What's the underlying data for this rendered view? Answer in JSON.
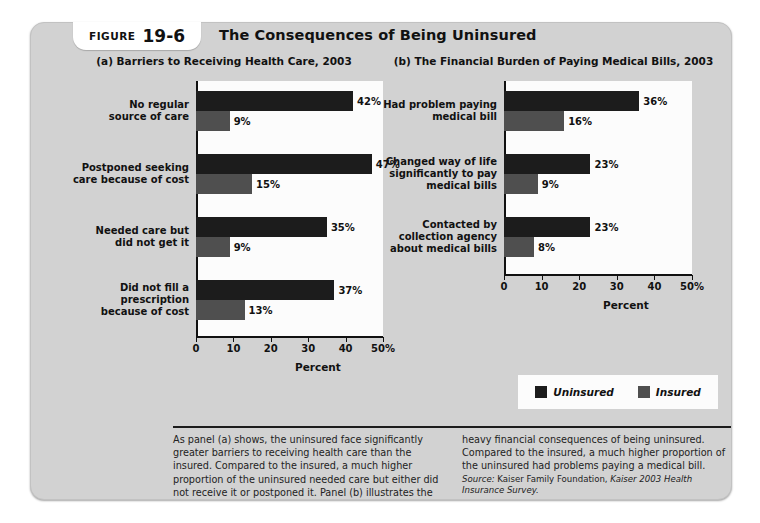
{
  "figure": {
    "label_word": "Figure",
    "number": "19-6",
    "title": "The Consequences of Being Uninsured"
  },
  "legend": {
    "items": [
      {
        "name": "Uninsured",
        "color": "#1c1c1c"
      },
      {
        "name": "Insured",
        "color": "#4f4f4f"
      }
    ]
  },
  "caption": {
    "left_text": "As panel (a) shows, the uninsured face significantly greater barriers to receiving health care than the insured. Compared to the insured, a much higher proportion of the uninsured needed care but either did not receive it or postponed it. Panel (b) illustrates the",
    "right_text": "heavy financial consequences of being uninsured. Compared to the insured, a much higher proportion of the uninsured had problems paying a medical bill.",
    "source_label": "Source:",
    "source_text": " Kaiser Family Foundation, ",
    "source_italic": "Kaiser 2003 Health Insurance Survey."
  },
  "chart_data": [
    {
      "type": "bar",
      "orientation": "horizontal",
      "panel": "(a)",
      "title": "(a) Barriers to Receiving Health Care, 2003",
      "xlabel": "Percent",
      "ylabel": "",
      "xlim": [
        0,
        50
      ],
      "ticks": [
        0,
        10,
        20,
        30,
        40,
        50
      ],
      "tick_labels": [
        "0",
        "10",
        "20",
        "30",
        "40",
        "50%"
      ],
      "grid": false,
      "legend_position": "below-right",
      "categories": [
        "No regular source of care",
        "Postponed seeking care because of cost",
        "Needed care but did not get it",
        "Did not fill a prescription because of cost"
      ],
      "category_lines": [
        [
          "No regular",
          "source of care"
        ],
        [
          "Postponed seeking",
          "care because of cost"
        ],
        [
          "Needed care but",
          "did not get it"
        ],
        [
          "Did not fill a",
          "prescription",
          "because of cost"
        ]
      ],
      "series": [
        {
          "name": "Uninsured",
          "color": "#1c1c1c",
          "values": [
            42,
            47,
            35,
            37
          ],
          "labels": [
            "42%",
            "47%",
            "35%",
            "37%"
          ]
        },
        {
          "name": "Insured",
          "color": "#4f4f4f",
          "values": [
            9,
            15,
            9,
            13
          ],
          "labels": [
            "9%",
            "15%",
            "9%",
            "13%"
          ]
        }
      ]
    },
    {
      "type": "bar",
      "orientation": "horizontal",
      "panel": "(b)",
      "title": "(b) The Financial Burden of Paying Medical Bills, 2003",
      "xlabel": "Percent",
      "ylabel": "",
      "xlim": [
        0,
        50
      ],
      "ticks": [
        0,
        10,
        20,
        30,
        40,
        50
      ],
      "tick_labels": [
        "0",
        "10",
        "20",
        "30",
        "40",
        "50%"
      ],
      "grid": false,
      "legend_position": "below",
      "categories": [
        "Had problem paying medical bill",
        "Changed way of life significantly to pay medical bills",
        "Contacted by collection agency about medical bills"
      ],
      "category_lines": [
        [
          "Had problem paying",
          "medical bill"
        ],
        [
          "Changed way of life",
          "significantly to pay",
          "medical bills"
        ],
        [
          "Contacted by",
          "collection agency",
          "about medical bills"
        ]
      ],
      "series": [
        {
          "name": "Uninsured",
          "color": "#1c1c1c",
          "values": [
            36,
            23,
            23
          ],
          "labels": [
            "36%",
            "23%",
            "23%"
          ]
        },
        {
          "name": "Insured",
          "color": "#4f4f4f",
          "values": [
            16,
            9,
            8
          ],
          "labels": [
            "16%",
            "9%",
            "8%"
          ]
        }
      ]
    }
  ]
}
